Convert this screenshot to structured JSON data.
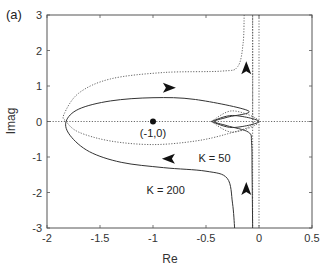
{
  "chart_data": {
    "type": "line",
    "title": "",
    "panel_label": "(a)",
    "xlabel": "Re",
    "ylabel": "Imag",
    "xlim": [
      -2,
      0.5
    ],
    "ylim": [
      -3,
      3
    ],
    "xticks": [
      -2,
      -1.5,
      -1,
      -0.5,
      0,
      0.5
    ],
    "xtick_labels": [
      "-2",
      "-1.5",
      "-1",
      "-0.5",
      "0",
      "0.5"
    ],
    "yticks": [
      -3,
      -2,
      -1,
      0,
      1,
      2,
      3
    ],
    "ytick_labels": [
      "-3",
      "-2",
      "-1",
      "0",
      "1",
      "2",
      "3"
    ],
    "grid": false,
    "legend": null,
    "critical_point": {
      "x": -1,
      "y": 0,
      "label": "(-1,0)"
    },
    "annotations": [
      {
        "text": "K = 50",
        "x": -0.42,
        "y": -1.15
      },
      {
        "text": "K = 200",
        "x": -0.88,
        "y": -2.05
      }
    ],
    "series": [
      {
        "name": "K = 200 (solid)",
        "style": "solid",
        "points": [
          [
            -0.06,
            -3.0
          ],
          [
            -0.065,
            -1.5
          ],
          [
            -0.07,
            -0.6
          ],
          [
            -0.1,
            -0.3
          ],
          [
            -0.3,
            -0.12
          ],
          [
            -0.42,
            0.0
          ],
          [
            -0.3,
            0.12
          ],
          [
            -0.1,
            0.3
          ],
          [
            -0.6,
            0.62
          ],
          [
            -1.0,
            0.67
          ],
          [
            -1.4,
            0.58
          ],
          [
            -1.7,
            0.35
          ],
          [
            -1.82,
            0.0
          ],
          [
            -1.78,
            -0.4
          ],
          [
            -1.6,
            -0.85
          ],
          [
            -1.3,
            -1.15
          ],
          [
            -0.9,
            -1.3
          ],
          [
            -0.5,
            -1.4
          ],
          [
            -0.3,
            -1.6
          ],
          [
            -0.25,
            -2.3
          ],
          [
            -0.23,
            -3.0
          ]
        ]
      },
      {
        "name": "K = 50 (dotted)",
        "style": "dotted",
        "points": [
          [
            -0.14,
            3.0
          ],
          [
            -0.15,
            2.2
          ],
          [
            -0.2,
            1.55
          ],
          [
            -0.35,
            1.42
          ],
          [
            -0.9,
            1.38
          ],
          [
            -1.4,
            1.2
          ],
          [
            -1.7,
            0.8
          ],
          [
            -1.84,
            0.2
          ],
          [
            -1.82,
            0.0
          ],
          [
            -1.7,
            -0.3
          ],
          [
            -1.4,
            -0.55
          ],
          [
            -1.0,
            -0.65
          ],
          [
            -0.6,
            -0.55
          ],
          [
            -0.3,
            -0.35
          ],
          [
            -0.07,
            -0.1
          ],
          [
            -0.06,
            0.3
          ],
          [
            -0.06,
            3.0
          ]
        ]
      },
      {
        "name": "small loop (solid)",
        "style": "solid",
        "points": [
          [
            -0.45,
            0.0
          ],
          [
            -0.25,
            0.17
          ],
          [
            0.0,
            0.0
          ],
          [
            -0.25,
            -0.17
          ],
          [
            -0.45,
            0.0
          ]
        ]
      },
      {
        "name": "small loop (dotted)",
        "style": "dotted",
        "points": [
          [
            -0.45,
            0.0
          ],
          [
            -0.25,
            0.3
          ],
          [
            0.0,
            0.0
          ],
          [
            -0.25,
            -0.3
          ],
          [
            -0.45,
            0.0
          ]
        ]
      }
    ],
    "reference_lines": [
      {
        "orientation": "horizontal",
        "value": 0,
        "style": "dotted"
      },
      {
        "orientation": "vertical",
        "value": 0,
        "style": "dotted"
      },
      {
        "orientation": "vertical",
        "value": -0.06,
        "style": "dotted"
      }
    ],
    "arrows": [
      {
        "x": -0.85,
        "y": 0.95,
        "direction": "right"
      },
      {
        "x": -0.85,
        "y": -1.05,
        "direction": "left"
      },
      {
        "x": -0.12,
        "y": 1.5,
        "direction": "up"
      },
      {
        "x": -0.12,
        "y": -1.9,
        "direction": "up"
      }
    ]
  }
}
